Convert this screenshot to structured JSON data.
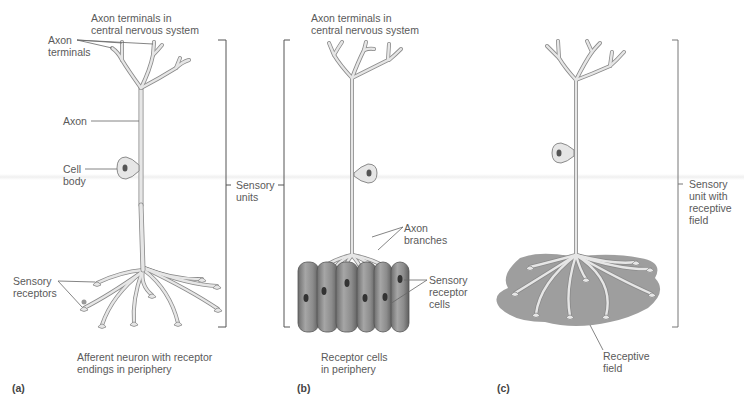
{
  "panels": [
    {
      "id": "a",
      "panel_label": "(a)",
      "caption": "Afferent neuron with receptor\nendings in periphery",
      "labels": {
        "axon_terminals_cns": "Axon terminals in\ncentral nervous system",
        "axon_terminals": "Axon\nterminals",
        "axon": "Axon",
        "cell_body": "Cell\nbody",
        "sensory_receptors": "Sensory\nreceptors"
      }
    },
    {
      "id": "b",
      "panel_label": "(b)",
      "caption": "Receptor cells\nin periphery",
      "labels": {
        "axon_terminals_cns": "Axon terminals in\ncentral nervous system",
        "axon_branches": "Axon\nbranches",
        "sensory_receptor_cells": "Sensory\nreceptor\ncells"
      }
    },
    {
      "id": "c",
      "panel_label": "(c)",
      "labels": {
        "sensory_unit_with_receptive_field": "Sensory\nunit with\nreceptive\nfield",
        "receptive_field": "Receptive\nfield"
      }
    }
  ],
  "shared": {
    "sensory_units": "Sensory\nunits"
  },
  "colors": {
    "neuron_fill": "#e6e6e6",
    "neuron_stroke": "#8a8a8a",
    "nucleus": "#555555",
    "receptor_cell": "#8f8f8f",
    "receptive_field": "#9e9e9e",
    "leader_line": "#666666",
    "text": "#5a5a5a"
  }
}
